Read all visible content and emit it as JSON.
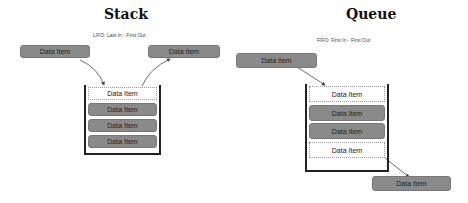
{
  "stack": {
    "title": "Stack",
    "subtitle": "LIFO:  Last In - First Out",
    "incoming": "Data Item",
    "outgoing": "Data Item",
    "items": [
      {
        "label": "Data Item",
        "state": "empty"
      },
      {
        "label": "Data Item",
        "state": "filled"
      },
      {
        "label": "Data Item",
        "state": "filled"
      },
      {
        "label": "Data Item",
        "state": "filled"
      }
    ]
  },
  "queue": {
    "title": "Queue",
    "subtitle": "FIFO:  First In - First Out",
    "incoming": "Data Item",
    "outgoing": "Data Item",
    "items": [
      {
        "label": "Data Item",
        "state": "empty"
      },
      {
        "label": "Data Item",
        "state": "filled"
      },
      {
        "label": "Data Item",
        "state": "filled"
      },
      {
        "label": "Data Item",
        "state": "empty"
      }
    ]
  }
}
